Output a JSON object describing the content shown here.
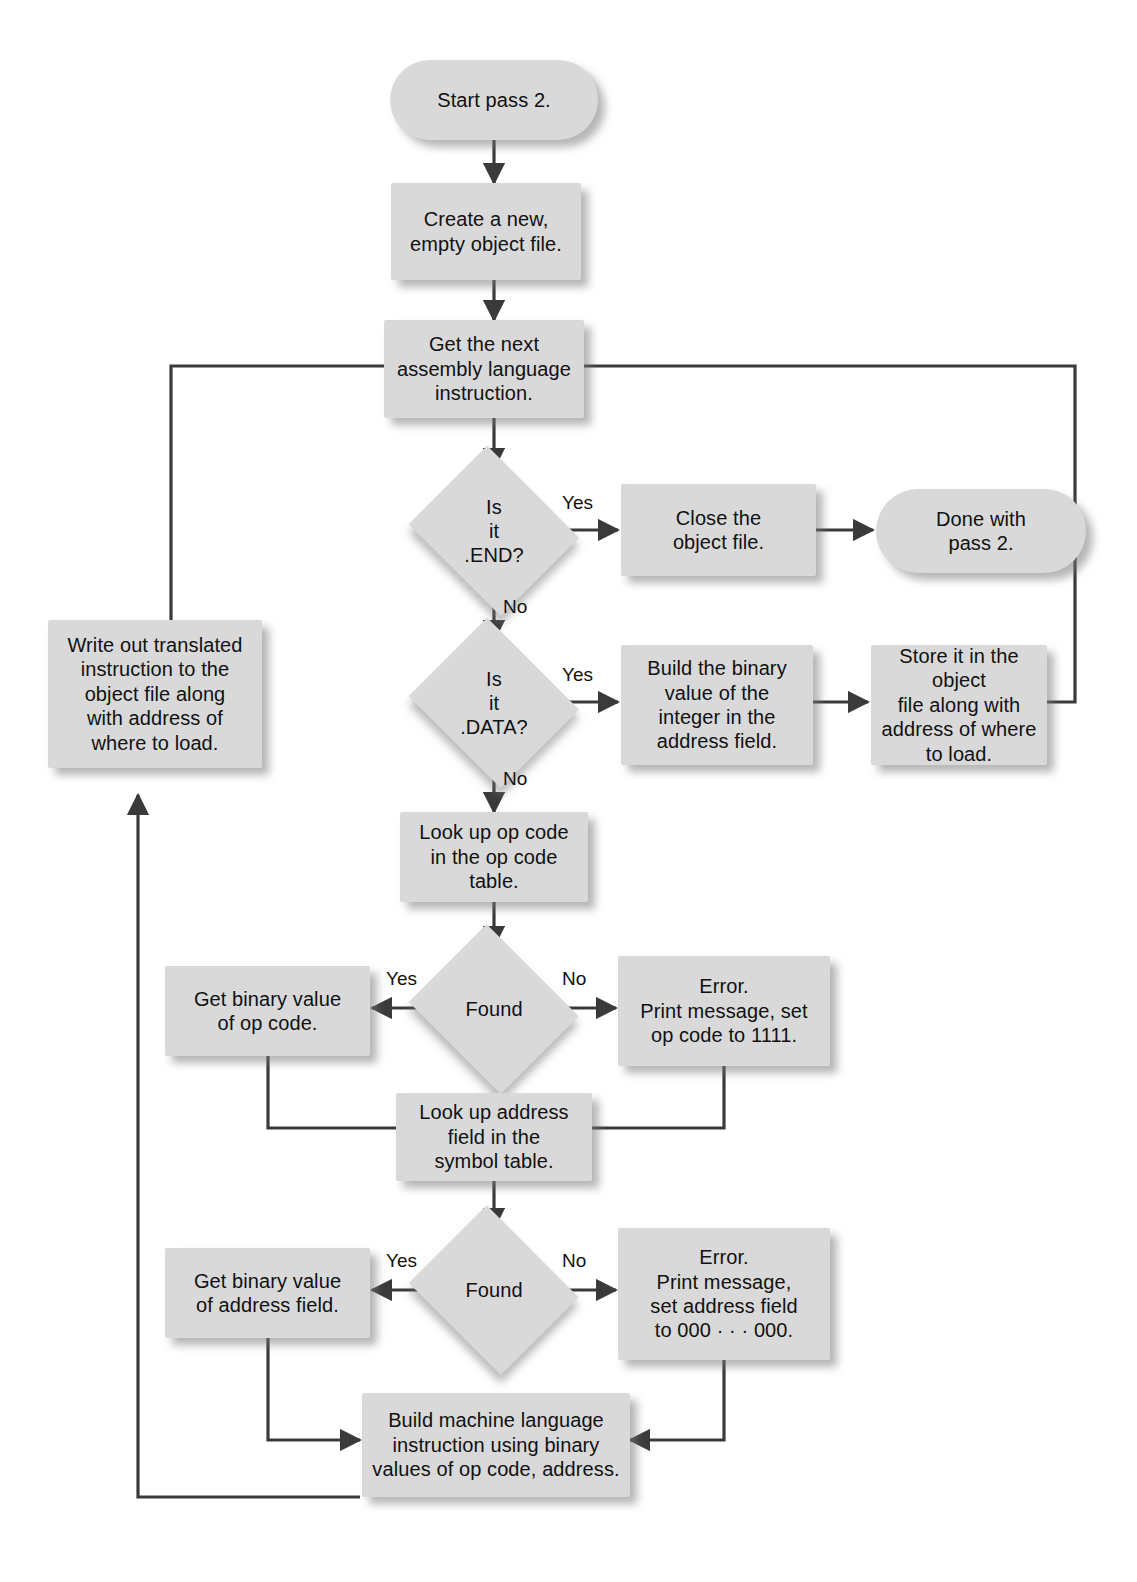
{
  "diagram": {
    "colors": {
      "node_fill": "#d9d9d9",
      "edge_stroke": "#3a3a3a",
      "text": "#111111",
      "background": "#ffffff"
    }
  },
  "nodes": {
    "start": {
      "label": "Start pass 2.",
      "shape": "terminator"
    },
    "create_file": {
      "label": "Create a new,\nempty object file.",
      "shape": "process"
    },
    "get_next": {
      "label": "Get the next\nassembly language\ninstruction.",
      "shape": "process"
    },
    "is_end": {
      "label": "Is\nit\n.END?",
      "shape": "decision"
    },
    "close_file": {
      "label": "Close the\nobject file.",
      "shape": "process"
    },
    "done": {
      "label": "Done with\npass 2.",
      "shape": "terminator"
    },
    "is_data": {
      "label": "Is\nit\n.DATA?",
      "shape": "decision"
    },
    "build_binary": {
      "label": "Build the binary\nvalue of the\ninteger in the\naddress field.",
      "shape": "process"
    },
    "store_it": {
      "label": "Store it in the object\nfile along with\naddress of where\nto load.",
      "shape": "process"
    },
    "write_out": {
      "label": "Write out translated\ninstruction to the\nobject file along\nwith address of\nwhere to load.",
      "shape": "process"
    },
    "lookup_op": {
      "label": "Look up op code\nin the op code\ntable.",
      "shape": "process"
    },
    "found_op": {
      "label": "Found",
      "shape": "decision"
    },
    "get_op_value": {
      "label": "Get binary value\nof op code.",
      "shape": "process"
    },
    "error_op": {
      "label": "Error.\nPrint message, set\nop code to 1111.",
      "shape": "process"
    },
    "lookup_addr": {
      "label": "Look up address\nfield in the\nsymbol table.",
      "shape": "process"
    },
    "found_addr": {
      "label": "Found",
      "shape": "decision"
    },
    "get_addr_value": {
      "label": "Get binary value\nof address field.",
      "shape": "process"
    },
    "error_addr": {
      "label": "Error.\nPrint message,\nset address field\nto 000 · · · 000.",
      "shape": "process"
    },
    "build_machine": {
      "label": "Build machine language\ninstruction using binary\nvalues of op code, address.",
      "shape": "process"
    }
  },
  "edge_labels": {
    "end_yes": "Yes",
    "end_no": "No",
    "data_yes": "Yes",
    "data_no": "No",
    "found_op_yes": "Yes",
    "found_op_no": "No",
    "found_addr_yes": "Yes",
    "found_addr_no": "No"
  }
}
